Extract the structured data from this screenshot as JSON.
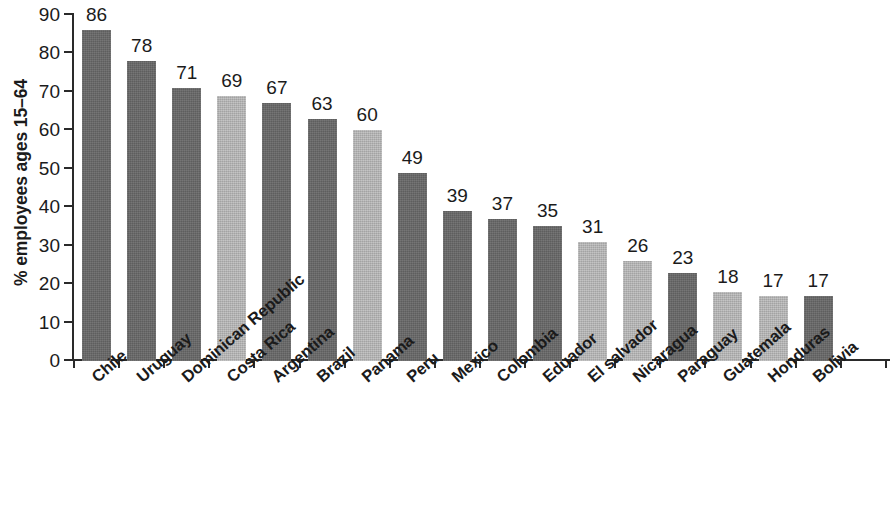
{
  "chart_data": {
    "type": "bar",
    "title": "",
    "subtitle": "",
    "xlabel": "",
    "ylabel": "% employees ages 15–64",
    "ylim": [
      0,
      90
    ],
    "ytick_values": [
      0,
      10,
      20,
      30,
      40,
      50,
      60,
      70,
      80,
      90
    ],
    "ytick_labels": [
      "0",
      "10",
      "20",
      "30",
      "40",
      "50",
      "60",
      "70",
      "80",
      "90"
    ],
    "grid": false,
    "legend": null,
    "categories": [
      "Chile",
      "Uruguay",
      "Dominican Republic",
      "Costa Rica",
      "Argentina",
      "Brazil",
      "Panama",
      "Peru",
      "Mexico",
      "Colombia",
      "Eduador",
      "El salvador",
      "Nicaragua",
      "Paraguay",
      "Guatemala",
      "Honduras",
      "Bolivia"
    ],
    "values": [
      86,
      78,
      71,
      69,
      67,
      63,
      60,
      49,
      39,
      37,
      35,
      31,
      26,
      23,
      18,
      17,
      17
    ],
    "value_labels": [
      "86",
      "78",
      "71",
      "69",
      "67",
      "63",
      "60",
      "49",
      "39",
      "37",
      "35",
      "31",
      "26",
      "23",
      "18",
      "17",
      "17"
    ],
    "bar_shades": [
      "dark",
      "dark",
      "dark",
      "light",
      "dark",
      "dark",
      "light",
      "dark",
      "dark",
      "dark",
      "dark",
      "light",
      "light",
      "dark",
      "light",
      "light",
      "dark"
    ],
    "colors": {
      "bar_dark": "#666666",
      "bar_light": "#b4b4b4",
      "axis": "#2a2a2a",
      "text": "#1b1b1b",
      "background": "#ffffff"
    }
  }
}
